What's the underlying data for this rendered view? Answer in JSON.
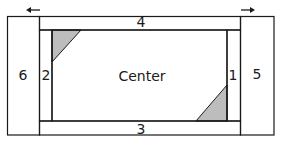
{
  "diagram": {
    "colors": {
      "stroke": "#1a1a1a",
      "fill_triangle": "#bdbdbd",
      "background": "#ffffff"
    },
    "pieces": [
      {
        "id": "6",
        "label": "6",
        "role": "left-outer-strip"
      },
      {
        "id": "5",
        "label": "5",
        "role": "right-outer-strip"
      },
      {
        "id": "4",
        "label": "4",
        "role": "top-strip"
      },
      {
        "id": "3",
        "label": "3",
        "role": "bottom-strip"
      },
      {
        "id": "2",
        "label": "2",
        "role": "left-inner-strip"
      },
      {
        "id": "1",
        "label": "1",
        "role": "right-inner-strip"
      },
      {
        "id": "center",
        "label": "Center",
        "role": "center-panel"
      }
    ],
    "arrows": [
      {
        "direction": "left",
        "glyph": "←"
      },
      {
        "direction": "right",
        "glyph": "→"
      }
    ],
    "triangles": [
      {
        "corner": "top-left",
        "shaded": true
      },
      {
        "corner": "bottom-right",
        "shaded": true
      }
    ]
  }
}
